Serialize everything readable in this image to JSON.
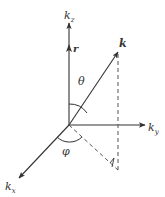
{
  "diagram": {
    "type": "spherical-coordinates-wavevector",
    "axes": {
      "z": {
        "label": "k",
        "subscript": "z"
      },
      "y": {
        "label": "k",
        "subscript": "y"
      },
      "x": {
        "label": "k",
        "subscript": "x"
      }
    },
    "vectors": {
      "k": {
        "label": "k"
      },
      "r": {
        "label": "r"
      }
    },
    "angles": {
      "polar": {
        "label": "θ"
      },
      "azimuth": {
        "label": "φ"
      }
    },
    "colors": {
      "line": "#333333",
      "dashed": "#555555"
    }
  }
}
